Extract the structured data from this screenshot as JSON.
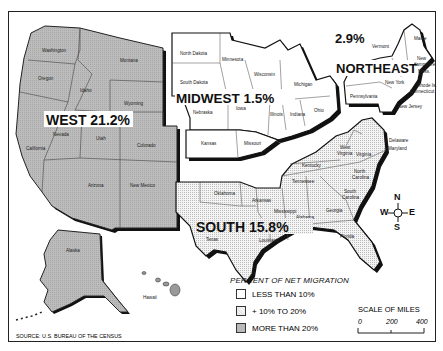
{
  "map": {
    "source": "SOURCE: U.S. BUREAU OF THE CENSUS",
    "regions": {
      "west": {
        "label": "WEST 21.2%",
        "percent": 21.2,
        "category": "more_than_20"
      },
      "midwest": {
        "label": "MIDWEST 1.5%",
        "percent": 1.5,
        "category": "less_than_10"
      },
      "northeast": {
        "label_pct": "2.9%",
        "label_name": "NORTHEAST",
        "percent": 2.9,
        "category": "less_than_10"
      },
      "south": {
        "label": "SOUTH 15.8%",
        "percent": 15.8,
        "category": "10_to_20"
      }
    },
    "states": {
      "washington": "Washington",
      "oregon": "Oregon",
      "california": "California",
      "idaho": "Idaho",
      "nevada": "Nevada",
      "montana": "Montana",
      "wyoming": "Wyoming",
      "utah": "Utah",
      "colorado": "Colorado",
      "arizona": "Arizona",
      "new_mexico": "New Mexico",
      "alaska": "Alaska",
      "hawaii": "Hawaii",
      "north_dakota": "North Dakota",
      "south_dakota": "South Dakota",
      "nebraska": "Nebraska",
      "kansas": "Kansas",
      "minnesota": "Minnesota",
      "iowa": "Iowa",
      "missouri": "Missouri",
      "wisconsin": "Wisconsin",
      "illinois": "Illinois",
      "michigan": "Michigan",
      "indiana": "Indiana",
      "ohio": "Ohio",
      "maine": "Maine",
      "vermont": "Vermont",
      "new_hampshire_1": "New",
      "new_hampshire_2": "Hampshire",
      "mass": "Mass.",
      "new_york": "New York",
      "rhode_island": "Rhode Is.",
      "connecticut": "Connecticut",
      "pennsylvania": "Pennsylvania",
      "new_jersey": "New Jersey",
      "delaware": "Delaware",
      "maryland": "Maryland",
      "west_virginia_1": "West",
      "west_virginia_2": "Virginia",
      "virginia": "Virginia",
      "kentucky": "Kentucky",
      "tennessee": "Tennessee",
      "north_carolina_1": "North",
      "north_carolina_2": "Carolina",
      "south_carolina_1": "South",
      "south_carolina_2": "Carolina",
      "georgia": "Georgia",
      "florida": "Florida",
      "alabama": "Alabama",
      "mississippi": "Mississippi",
      "louisiana": "Louisiana",
      "arkansas": "Arkansas",
      "oklahoma": "Oklahoma",
      "texas": "Texas"
    },
    "compass": {
      "n": "N",
      "s": "S",
      "e": "E",
      "w": "W"
    },
    "legend": {
      "title": "PERCENT OF NET MIGRATION",
      "items": [
        {
          "label": "LESS THAN 10%",
          "fill": "#ffffff"
        },
        {
          "label": "+ 10% TO 20%",
          "fill": "#ececec"
        },
        {
          "label": "MORE THAN 20%",
          "fill": "#b9b9b9"
        }
      ]
    },
    "scale": {
      "title": "SCALE OF MILES",
      "ticks": [
        "0",
        "200",
        "400"
      ]
    },
    "colors": {
      "west_fill": "#b9b9b9",
      "south_fill": "#ececec",
      "white_fill": "#ffffff",
      "border": "#111111"
    }
  }
}
